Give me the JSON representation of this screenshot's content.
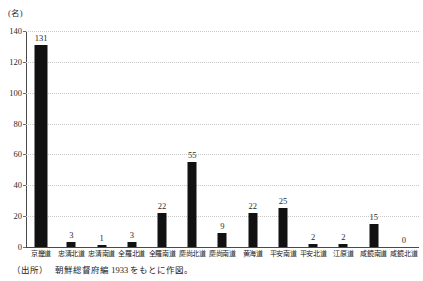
{
  "figure": {
    "unit_label": "(名)",
    "source_prefix": "（出所）",
    "source_text": "朝鮮総督府編 1933 をもとに作図。"
  },
  "chart_data": {
    "type": "bar",
    "title": "",
    "subtitle": "",
    "xlabel": "",
    "ylabel": "(名)",
    "ylim": [
      0,
      140
    ],
    "yticks": [
      0,
      20,
      40,
      60,
      80,
      100,
      120,
      140
    ],
    "grid": true,
    "legend": false,
    "bar_labels": true,
    "categories": [
      "京畿道",
      "忠清北道",
      "忠清南道",
      "全羅北道",
      "全羅南道",
      "慶尚北道",
      "慶尚南道",
      "黄海道",
      "平安南道",
      "平安北道",
      "江原道",
      "咸鏡南道",
      "咸鏡北道"
    ],
    "values": [
      131,
      3,
      1,
      3,
      22,
      55,
      9,
      22,
      25,
      2,
      2,
      15,
      0
    ],
    "colors": {
      "bar": "#111111",
      "grid": "#c9c9c9",
      "axis": "#4a4a4a",
      "text": "#222222"
    }
  }
}
